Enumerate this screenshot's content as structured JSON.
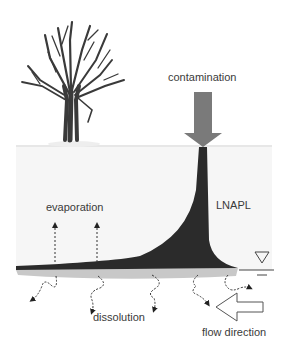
{
  "diagram": {
    "labels": {
      "contamination": "contamination",
      "lnapl": "LNAPL",
      "evaporation": "evaporation",
      "dissolution": "dissolution",
      "flow_direction": "flow direction"
    },
    "elements": {
      "tree": "bare-tree-icon",
      "source_arrow": "down-arrow-icon",
      "plume": "lnapl-plume",
      "water_table_symbol": "water-table-icon",
      "flow_arrow": "hollow-left-arrow-icon"
    },
    "colors": {
      "plume": "#2b2b2b",
      "dissolved_layer": "#c8c8c8",
      "source_arrow": "#7a7a7a",
      "ground_line": "#cfcfcf",
      "text": "#3a3a3a"
    }
  }
}
